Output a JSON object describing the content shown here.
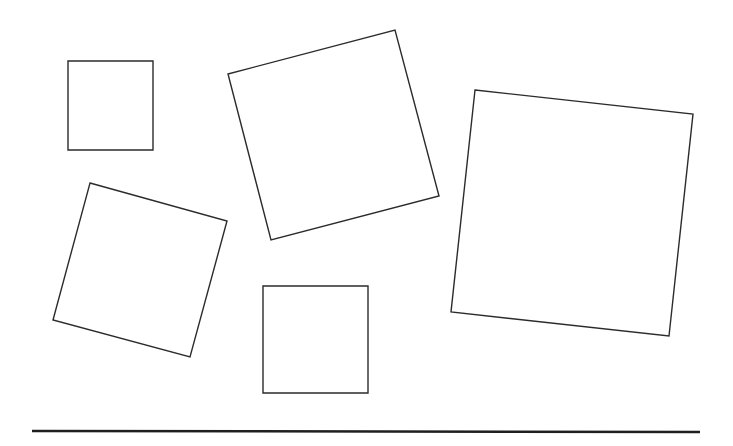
{
  "canvas": {
    "width": 733,
    "height": 446,
    "background": "#ffffff",
    "stroke_color": "#2b2b2b"
  },
  "shapes": [
    {
      "id": "square-1",
      "kind": "square",
      "points": "68,61 153,61 153,150 68,150"
    },
    {
      "id": "square-2",
      "kind": "rotated-square",
      "points": "228,74 395,30 439,196 271,240"
    },
    {
      "id": "square-3",
      "kind": "rotated-square",
      "points": "475,90 693,114 669,336 451,312"
    },
    {
      "id": "square-4",
      "kind": "rotated-square",
      "points": "90,183 227,221 190,357 53,320"
    },
    {
      "id": "square-5",
      "kind": "square",
      "points": "263,286 368,286 368,393 263,393"
    }
  ],
  "baseline": {
    "x1": 32,
    "y1": 431,
    "x2": 700,
    "y2": 432,
    "color": "#1f1f1f"
  }
}
